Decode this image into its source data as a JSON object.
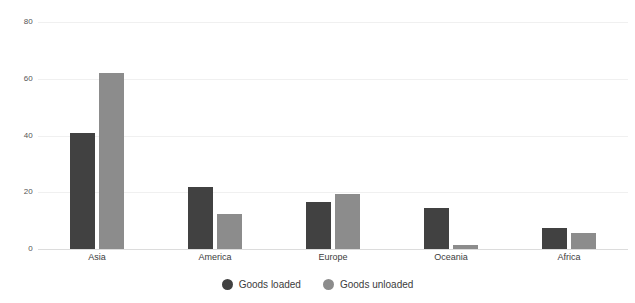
{
  "chart_data": {
    "type": "bar",
    "title": "",
    "subtitle": "",
    "xlabel": "",
    "ylabel": "",
    "categories": [
      "Asia",
      "America",
      "Europe",
      "Oceania",
      "Africa"
    ],
    "series": [
      {
        "name": "Goods loaded",
        "color": "#414141",
        "values": [
          41.0,
          22.0,
          16.5,
          14.5,
          7.5
        ]
      },
      {
        "name": "Goods unloaded",
        "color": "#8c8c8c",
        "values": [
          62.0,
          12.5,
          19.5,
          1.5,
          5.5
        ]
      }
    ],
    "ylim": [
      0,
      80
    ],
    "yticks": [
      0,
      20,
      40,
      60,
      80
    ],
    "ytick_labels": [
      "0",
      "20",
      "40",
      "60",
      "80"
    ],
    "grid": true,
    "grid_color": "#f0f0f0",
    "baseline_color": "#dcdcdc",
    "legend_position": "bottom-center"
  },
  "legend": {
    "items": [
      {
        "label": "Goods loaded",
        "color": "#414141"
      },
      {
        "label": "Goods unloaded",
        "color": "#8c8c8c"
      }
    ]
  }
}
